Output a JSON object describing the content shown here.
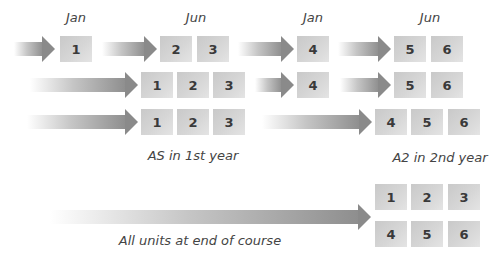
{
  "diagram": {
    "month_labels": [
      {
        "text": "Jan",
        "x": 76
      },
      {
        "text": "Jun",
        "x": 196
      },
      {
        "text": "Jan",
        "x": 313
      },
      {
        "text": "Jun",
        "x": 430
      }
    ],
    "rows": [
      {
        "id": "row-1",
        "arrows": [
          [
            14,
            55
          ],
          [
            102,
            157
          ],
          [
            238,
            294
          ],
          [
            338,
            391
          ]
        ],
        "boxes": [
          {
            "label": "1",
            "x": 60
          },
          {
            "label": "2",
            "x": 160
          },
          {
            "label": "3",
            "x": 197
          },
          {
            "label": "4",
            "x": 297
          },
          {
            "label": "5",
            "x": 394
          },
          {
            "label": "6",
            "x": 431
          }
        ]
      },
      {
        "id": "row-2",
        "arrows": [
          [
            30,
            138
          ],
          [
            255,
            294
          ],
          [
            340,
            391
          ]
        ],
        "boxes": [
          {
            "label": "1",
            "x": 141
          },
          {
            "label": "2",
            "x": 177
          },
          {
            "label": "3",
            "x": 213
          },
          {
            "label": "4",
            "x": 297
          },
          {
            "label": "5",
            "x": 394
          },
          {
            "label": "6",
            "x": 431
          }
        ]
      },
      {
        "id": "row-3",
        "arrows": [
          [
            27,
            138
          ],
          [
            262,
            372
          ]
        ],
        "boxes": [
          {
            "label": "1",
            "x": 141
          },
          {
            "label": "2",
            "x": 177
          },
          {
            "label": "3",
            "x": 213
          },
          {
            "label": "4",
            "x": 375
          },
          {
            "label": "5",
            "x": 411
          },
          {
            "label": "6",
            "x": 448
          }
        ]
      }
    ],
    "captions": {
      "as": "AS in 1st year",
      "a2": "A2 in 2nd year",
      "all": "All units at end of course"
    },
    "final_grid": [
      "1",
      "2",
      "3",
      "4",
      "5",
      "6"
    ]
  }
}
